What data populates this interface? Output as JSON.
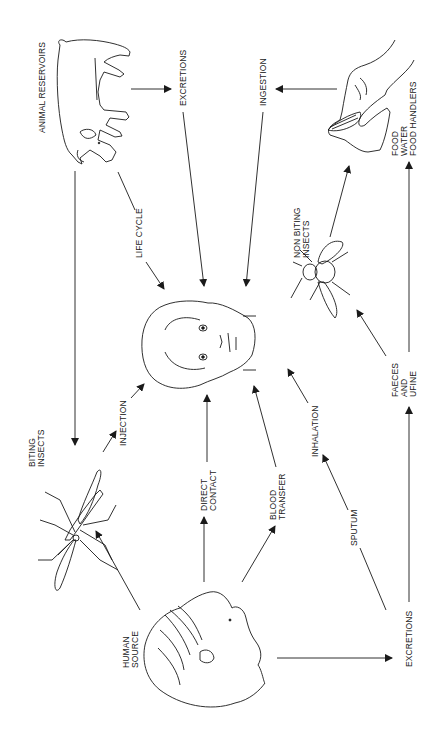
{
  "diagram": {
    "title": "",
    "orientation": "rotated-90-ccw",
    "nodes": {
      "animal_reservoirs": {
        "label": "ANIMAL RESERVOIRS",
        "icon": "pig-icon"
      },
      "food_sources": {
        "lines": [
          "FOOD",
          "WATER",
          "FOOD HANDLERS"
        ],
        "icon": "hand-with-food-icon"
      },
      "non_biting_insects": {
        "lines": [
          "NON BITING",
          "INSECTS"
        ],
        "icon": "fly-icon"
      },
      "biting_insects": {
        "lines": [
          "BITING",
          "INSECTS"
        ],
        "icon": "mosquito-icon"
      },
      "faeces_urine": {
        "lines": [
          "FAECES",
          "AND",
          "UFINE"
        ]
      },
      "human_source": {
        "lines": [
          "HUMAN",
          "SOURCE"
        ],
        "icon": "human-head-profile-icon"
      },
      "host": {
        "icon": "human-face-icon"
      }
    },
    "edge_labels": {
      "excretions_top": "EXCRETIONS",
      "ingestion": "INGESTION",
      "life_cycle": "LIFE CYCLE",
      "injection": "INJECTION",
      "direct_contact": [
        "DIRECT",
        "CONTACT"
      ],
      "blood_transfer": [
        "BLOOD",
        "TRANSFER"
      ],
      "inhalation": "INHALATION",
      "sputum": "SPUTUM",
      "excretions_bottom": "EXCRETIONS"
    },
    "edges": [
      {
        "from": "ANIMAL RESERVOIRS",
        "to": "EXCRETIONS",
        "via": ""
      },
      {
        "from": "EXCRETIONS",
        "to": "HOST",
        "via": ""
      },
      {
        "from": "FOOD / WATER / FOOD HANDLERS",
        "to": "INGESTION",
        "via": ""
      },
      {
        "from": "INGESTION",
        "to": "HOST",
        "via": ""
      },
      {
        "from": "ANIMAL RESERVOIRS",
        "to": "HOST",
        "via": "LIFE CYCLE"
      },
      {
        "from": "ANIMAL RESERVOIRS",
        "to": "BITING INSECTS",
        "via": ""
      },
      {
        "from": "BITING INSECTS",
        "to": "HOST",
        "via": "INJECTION"
      },
      {
        "from": "HUMAN SOURCE",
        "to": "BITING INSECTS",
        "via": ""
      },
      {
        "from": "HUMAN SOURCE",
        "to": "HOST",
        "via": "DIRECT CONTACT"
      },
      {
        "from": "HUMAN SOURCE",
        "to": "HOST",
        "via": "BLOOD TRANSFER"
      },
      {
        "from": "HUMAN SOURCE",
        "to": "EXCRETIONS",
        "via": ""
      },
      {
        "from": "EXCRETIONS",
        "to": "HOST",
        "via": "SPUTUM / INHALATION"
      },
      {
        "from": "EXCRETIONS",
        "to": "FAECES AND URINE",
        "via": ""
      },
      {
        "from": "FAECES AND URINE",
        "to": "NON BITING INSECTS",
        "via": ""
      },
      {
        "from": "FAECES AND URINE",
        "to": "FOOD / WATER / FOOD HANDLERS",
        "via": ""
      },
      {
        "from": "NON BITING INSECTS",
        "to": "FOOD / WATER / FOOD HANDLERS",
        "via": ""
      }
    ],
    "colors": {
      "ink": "#1a1a1a",
      "background": "#ffffff"
    }
  }
}
